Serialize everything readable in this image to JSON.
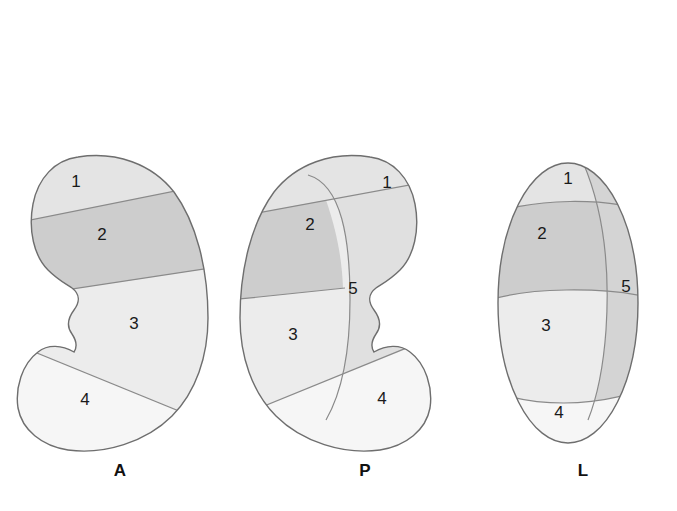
{
  "figure": {
    "background_color": "#ffffff",
    "outline_color": "#6e6e6e",
    "divider_color": "#8a8a8a"
  },
  "palette": {
    "segment_1": "#e4e4e4",
    "segment_2": "#cdcdcd",
    "segment_3": "#ececec",
    "segment_4": "#f6f6f6",
    "segment_5_light": "#e0e0e0",
    "segment_5_dark": "#d4d4d4"
  },
  "views": [
    {
      "key": "anterior",
      "caption": "A",
      "segments": [
        {
          "id": "1",
          "label": "1"
        },
        {
          "id": "2",
          "label": "2"
        },
        {
          "id": "3",
          "label": "3"
        },
        {
          "id": "4",
          "label": "4"
        }
      ]
    },
    {
      "key": "posterior",
      "caption": "P",
      "segments": [
        {
          "id": "1",
          "label": "1"
        },
        {
          "id": "2",
          "label": "2"
        },
        {
          "id": "3",
          "label": "3"
        },
        {
          "id": "4",
          "label": "4"
        },
        {
          "id": "5",
          "label": "5"
        }
      ]
    },
    {
      "key": "lateral",
      "caption": "L",
      "segments": [
        {
          "id": "1",
          "label": "1"
        },
        {
          "id": "2",
          "label": "2"
        },
        {
          "id": "3",
          "label": "3"
        },
        {
          "id": "4",
          "label": "4"
        },
        {
          "id": "5",
          "label": "5"
        }
      ]
    }
  ]
}
